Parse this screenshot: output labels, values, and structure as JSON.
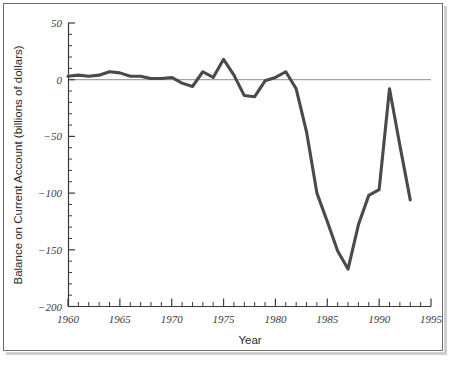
{
  "figure": {
    "background_color": "#ffffff",
    "frame_color": "#6d6d6d",
    "shadow_color": "#cfcfcf"
  },
  "axes": {
    "x_title": "Year",
    "y_title": "Balance on Current Account (billions of dollars)",
    "x_tick_labels": [
      "1960",
      "1965",
      "1970",
      "1975",
      "1980",
      "1985",
      "1990",
      "1995"
    ],
    "y_tick_labels": [
      "50",
      "0",
      "−50",
      "−100",
      "−150",
      "−200"
    ],
    "axis_color": "#3b3b3b",
    "zero_line_color": "#8e8e8e",
    "line_color": "#4a4a4a"
  },
  "chart_data": {
    "type": "line",
    "title": "",
    "xlabel": "Year",
    "ylabel": "Balance on Current Account (billions of dollars)",
    "xlim": [
      1960,
      1995
    ],
    "ylim": [
      -200,
      50
    ],
    "xticks": [
      1960,
      1965,
      1970,
      1975,
      1980,
      1985,
      1990,
      1995
    ],
    "yticks": [
      50,
      0,
      -50,
      -100,
      -150,
      -200
    ],
    "minor_xtick_interval": 1,
    "minor_ytick_interval": 10,
    "grid": false,
    "legend": null,
    "zero_reference_line": 0,
    "series": [
      {
        "name": "Balance on Current Account",
        "x": [
          1960,
          1961,
          1962,
          1963,
          1964,
          1965,
          1966,
          1967,
          1968,
          1969,
          1970,
          1971,
          1972,
          1973,
          1974,
          1975,
          1976,
          1977,
          1978,
          1979,
          1980,
          1981,
          1982,
          1983,
          1984,
          1985,
          1986,
          1987,
          1988,
          1989,
          1990,
          1991,
          1992,
          1993
        ],
        "values": [
          3,
          4,
          3,
          4,
          7,
          6,
          3,
          3,
          1,
          1,
          2,
          -3,
          -6,
          7,
          2,
          18,
          4,
          -14,
          -15,
          -1,
          2,
          7,
          -8,
          -46,
          -100,
          -125,
          -151,
          -167,
          -128,
          -102,
          -97,
          -8,
          -58,
          -106
        ]
      }
    ]
  }
}
